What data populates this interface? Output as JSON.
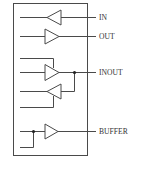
{
  "diagram": {
    "type": "io-cell-block",
    "colors": {
      "stroke": "#4a4a4a",
      "text": "#333333",
      "background": "#ffffff"
    },
    "ports": [
      {
        "id": "in",
        "label": "IN",
        "direction": "input",
        "buffers": 1
      },
      {
        "id": "out",
        "label": "OUT",
        "direction": "output",
        "buffers": 1
      },
      {
        "id": "inout",
        "label": "INOUT",
        "direction": "bidirectional",
        "buffers": 2
      },
      {
        "id": "buffer",
        "label": "BUFFER",
        "direction": "output-with-feedback",
        "buffers": 1
      }
    ]
  }
}
